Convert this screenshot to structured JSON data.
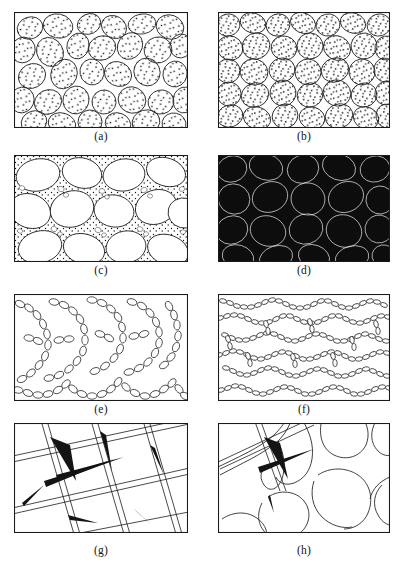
{
  "figure": {
    "background_color": "#ffffff",
    "ink_color": "#1a1a1a",
    "width": 404,
    "height": 573
  },
  "captions": [
    {
      "id": "a",
      "label": "(a)"
    },
    {
      "id": "b",
      "label": "(b)"
    },
    {
      "id": "c",
      "label": "(c)"
    },
    {
      "id": "d",
      "label": "(d)"
    },
    {
      "id": "e",
      "label": "(e)"
    },
    {
      "id": "f",
      "label": "(f)"
    },
    {
      "id": "g",
      "label": "(g)"
    },
    {
      "id": "h",
      "label": "(h)"
    }
  ],
  "panels": [
    {
      "id": "a",
      "caption": "(a)",
      "row": 1,
      "column": 1,
      "description": "Rounded polygonal grains with stippled interiors, moderate packing, thin grain boundaries, white matrix between grains",
      "frame": {
        "x": 14,
        "y": 12,
        "width": 174,
        "height": 116
      },
      "fill_style": "white",
      "grain_count": 38,
      "stipple": true
    },
    {
      "id": "b",
      "caption": "(b)",
      "row": 1,
      "column": 2,
      "description": "Densely packed rounded grains with stippled interiors, grains touching with little interstitial space",
      "frame": {
        "x": 218,
        "y": 12,
        "width": 172,
        "height": 116
      },
      "fill_style": "white",
      "grain_count": 44,
      "stipple": true
    },
    {
      "id": "c",
      "caption": "(c)",
      "row": 2,
      "column": 1,
      "description": "Large smooth white blobs separated by regions of fine stippled small particles",
      "frame": {
        "x": 14,
        "y": 155,
        "width": 174,
        "height": 107
      },
      "fill_style": "white",
      "grain_count": 16,
      "fines": true
    },
    {
      "id": "d",
      "caption": "(d)",
      "row": 2,
      "column": 2,
      "description": "Stippled grains on a solid black background, thick dark intergranular films",
      "frame": {
        "x": 218,
        "y": 155,
        "width": 172,
        "height": 107
      },
      "fill_style": "black-matrix",
      "grain_count": 26,
      "stipple": true
    },
    {
      "id": "e",
      "caption": "(e)",
      "row": 3,
      "column": 1,
      "description": "Network of chained small ellipses (bead strings) enclosing open cells",
      "frame": {
        "x": 14,
        "y": 294,
        "width": 174,
        "height": 107
      },
      "fill_style": "white",
      "bead_chains": 22
    },
    {
      "id": "f",
      "caption": "(f)",
      "row": 3,
      "column": 2,
      "description": "Dense, finer bead chains with preferred horizontal alignment filling the frame",
      "frame": {
        "x": 218,
        "y": 294,
        "width": 172,
        "height": 107
      },
      "fill_style": "white",
      "bead_chains": 48
    },
    {
      "id": "g",
      "caption": "(g)",
      "row": 4,
      "column": 1,
      "description": "Intersecting straight crack lines forming a coarse diagonal grid with lenticular wedge openings",
      "frame": {
        "x": 14,
        "y": 423,
        "width": 174,
        "height": 110
      },
      "fill_style": "white",
      "crack_lines": 9
    },
    {
      "id": "h",
      "caption": "(h)",
      "row": 4,
      "column": 2,
      "description": "Few large rounded cells with thin curved boundaries plus one lenticular wedge crack at upper left",
      "frame": {
        "x": 218,
        "y": 423,
        "width": 172,
        "height": 110
      },
      "fill_style": "white",
      "crack_lines": 3
    }
  ]
}
